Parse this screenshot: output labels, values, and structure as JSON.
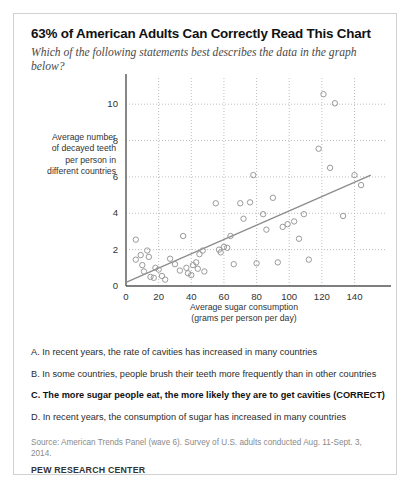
{
  "card": {
    "title": "63% of American Adults Can Correctly Read This Chart",
    "subtitle": "Which of the following statements best describes the data in the graph below?"
  },
  "answers": [
    {
      "id": "A",
      "text": "A. In recent years, the rate of cavities has increased in many countries",
      "correct": false
    },
    {
      "id": "B",
      "text": "B. In some countries, people brush their teeth more frequently than in other countries",
      "correct": false
    },
    {
      "id": "C",
      "text": "C. The more sugar people eat, the more likely they are to get cavities (CORRECT)",
      "correct": true
    },
    {
      "id": "D",
      "text": "D. In recent years, the consumption of sugar has increased in many countries",
      "correct": false
    }
  ],
  "footer": {
    "source": "Source: American Trends Panel (wave 6). Survey of U.S. adults conducted Aug. 11-Sept. 3, 2014.",
    "brand": "PEW RESEARCH CENTER"
  },
  "chart_data": {
    "type": "scatter",
    "title": "",
    "xlabel": "Average sugar consumption\n(grams per person per day)",
    "xlabel_line1": "Average sugar consumption",
    "xlabel_line2": "(grams per person per day)",
    "ylabel": "Average number of decayed teeth per person in different countries",
    "ylabel_line1": "Average number",
    "ylabel_line2": "of decayed teeth",
    "ylabel_line3": "per person in",
    "ylabel_line4": "different countries",
    "xlim": [
      0,
      155
    ],
    "ylim": [
      0,
      11
    ],
    "xticks": [
      0,
      20,
      40,
      60,
      80,
      100,
      120,
      140
    ],
    "yticks": [
      0,
      2,
      4,
      6,
      8,
      10
    ],
    "grid": "dotted",
    "legend": "none",
    "point_color": "#9a9a9a",
    "line_color": "#8c8c8c",
    "grid_color": "#bdbdbd",
    "axis_color": "#555555",
    "trendline": {
      "x0": 0,
      "y0": 0.2,
      "x1": 150,
      "y1": 6.1
    },
    "points": [
      [
        6,
        2.55
      ],
      [
        6,
        1.45
      ],
      [
        9,
        1.7
      ],
      [
        10,
        1.15
      ],
      [
        11,
        0.8
      ],
      [
        13,
        1.95
      ],
      [
        14,
        1.6
      ],
      [
        15,
        0.5
      ],
      [
        17,
        0.45
      ],
      [
        18,
        1.0
      ],
      [
        20,
        0.9
      ],
      [
        22,
        0.55
      ],
      [
        24,
        0.35
      ],
      [
        27,
        1.5
      ],
      [
        30,
        1.2
      ],
      [
        33,
        0.85
      ],
      [
        35,
        2.75
      ],
      [
        37,
        1.0
      ],
      [
        38,
        0.7
      ],
      [
        40,
        0.6
      ],
      [
        41,
        1.15
      ],
      [
        43,
        1.3
      ],
      [
        44,
        0.95
      ],
      [
        45,
        1.75
      ],
      [
        47,
        1.95
      ],
      [
        48,
        0.8
      ],
      [
        55,
        4.55
      ],
      [
        57,
        2.0
      ],
      [
        58,
        1.85
      ],
      [
        60,
        2.15
      ],
      [
        62,
        2.1
      ],
      [
        64,
        2.75
      ],
      [
        66,
        1.2
      ],
      [
        70,
        4.55
      ],
      [
        72,
        3.7
      ],
      [
        76,
        4.6
      ],
      [
        78,
        6.1
      ],
      [
        80,
        1.25
      ],
      [
        84,
        3.95
      ],
      [
        86,
        3.1
      ],
      [
        90,
        4.85
      ],
      [
        93,
        1.3
      ],
      [
        96,
        3.25
      ],
      [
        99,
        3.4
      ],
      [
        103,
        3.55
      ],
      [
        106,
        2.6
      ],
      [
        109,
        3.95
      ],
      [
        112,
        1.45
      ],
      [
        118,
        7.55
      ],
      [
        121,
        10.55
      ],
      [
        125,
        6.5
      ],
      [
        128,
        10.05
      ],
      [
        133,
        3.85
      ],
      [
        140,
        6.1
      ],
      [
        144,
        5.55
      ]
    ]
  }
}
